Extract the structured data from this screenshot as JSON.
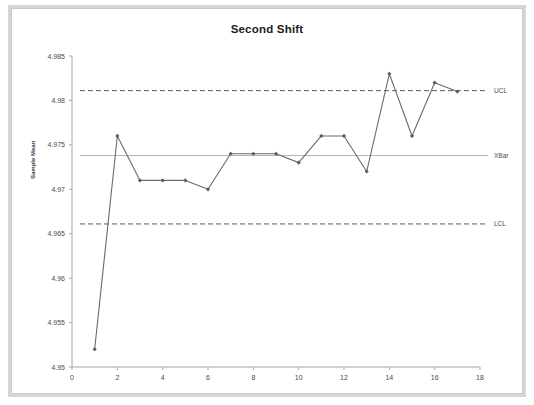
{
  "chart_data": {
    "type": "line",
    "title": "Second Shift",
    "xlabel": "",
    "ylabel": "Sample Mean",
    "x": [
      1,
      2,
      3,
      4,
      5,
      6,
      7,
      8,
      9,
      10,
      11,
      12,
      13,
      14,
      15,
      16,
      17
    ],
    "values": [
      4.952,
      4.976,
      4.971,
      4.971,
      4.971,
      4.97,
      4.974,
      4.974,
      4.974,
      4.973,
      4.976,
      4.976,
      4.972,
      4.983,
      4.976,
      4.982,
      4.981
    ],
    "series": [
      {
        "name": "Sample Mean",
        "values": [
          4.952,
          4.976,
          4.971,
          4.971,
          4.971,
          4.97,
          4.974,
          4.974,
          4.974,
          4.973,
          4.976,
          4.976,
          4.972,
          4.983,
          4.976,
          4.982,
          4.981
        ]
      }
    ],
    "xlim": [
      0,
      18
    ],
    "ylim": [
      4.95,
      4.985
    ],
    "xticks": [
      0,
      2,
      4,
      6,
      8,
      10,
      12,
      14,
      16,
      18
    ],
    "xtick_labels": [
      "0",
      "2",
      "4",
      "6",
      "8",
      "10",
      "12",
      "14",
      "16",
      "18"
    ],
    "yticks": [
      4.95,
      4.955,
      4.96,
      4.965,
      4.97,
      4.975,
      4.98,
      4.985
    ],
    "ytick_labels": [
      "4.95",
      "4.955",
      "4.96",
      "4.965",
      "4.97",
      "4.975",
      "4.98",
      "4.985"
    ],
    "grid": false,
    "legend_position": "right-inline",
    "control_limits": [
      {
        "name": "UCL",
        "label": "UCL",
        "value": 4.9811,
        "style": "dashed"
      },
      {
        "name": "XBar",
        "label": "XBar",
        "value": 4.9738,
        "style": "solid"
      },
      {
        "name": "LCL",
        "label": "LCL",
        "value": 4.9661,
        "style": "dashed"
      }
    ],
    "colors": {
      "series": "#6b6b6b",
      "marker": "#5d5d5d",
      "control_dashed": "#5d5d5d",
      "control_solid": "#b4b4b4",
      "axis": "#a6a6a6",
      "text": "#4a4a4a",
      "title": "#1b1b1b",
      "frame": "#d6d6d6",
      "background": "#ffffff"
    }
  }
}
